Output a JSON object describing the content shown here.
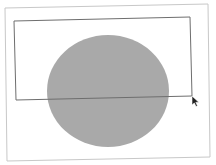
{
  "canvas": {
    "background": "#ffffff",
    "frame": {
      "stroke": "#c8c8c8",
      "points": "5,8 208,4 210,157 7,161"
    },
    "shape": {
      "type": "ellipse",
      "cx": 108,
      "cy": 91,
      "rx": 61,
      "ry": 56,
      "fill": "#a9a9a9"
    },
    "selection_rect": {
      "stroke": "#6e6e6e",
      "points": "14,21 190,17 192,96 16,100"
    },
    "cursor": {
      "type": "arrow-pointer",
      "x": 192,
      "y": 96,
      "color": "#222222"
    }
  }
}
